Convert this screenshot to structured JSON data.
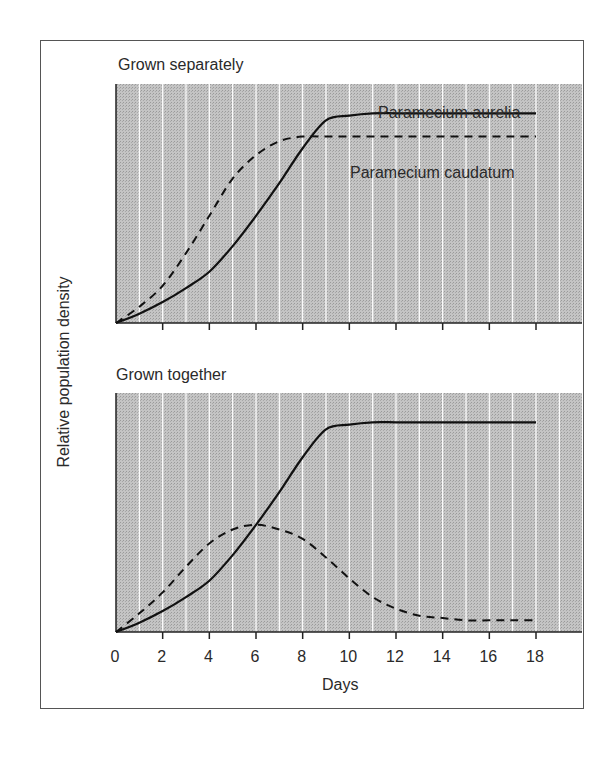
{
  "chart_data": [
    {
      "type": "line",
      "title": "Grown separately",
      "xlabel": "Days",
      "ylabel": "Relative population density",
      "x": [
        0,
        1,
        2,
        3,
        4,
        5,
        6,
        7,
        8,
        9,
        10,
        11,
        12,
        13,
        14,
        15,
        16,
        17,
        18
      ],
      "xlim": [
        0,
        18
      ],
      "xticks": [
        0,
        2,
        4,
        6,
        8,
        10,
        12,
        14,
        16,
        18
      ],
      "ylim": [
        0,
        1
      ],
      "grid": "vertical white lines every 1 day",
      "series": [
        {
          "name": "Paramecium aurelia",
          "style": "solid",
          "values": [
            0.0,
            0.04,
            0.09,
            0.15,
            0.22,
            0.33,
            0.46,
            0.6,
            0.75,
            0.87,
            0.89,
            0.9,
            0.9,
            0.9,
            0.9,
            0.9,
            0.9,
            0.9,
            0.9
          ]
        },
        {
          "name": "Paramecium caudatum",
          "style": "dashed",
          "values": [
            0.0,
            0.07,
            0.16,
            0.3,
            0.46,
            0.62,
            0.72,
            0.78,
            0.8,
            0.8,
            0.8,
            0.8,
            0.8,
            0.8,
            0.8,
            0.8,
            0.8,
            0.8,
            0.8
          ]
        }
      ],
      "annotations": [
        "Paramecium aurelia",
        "Paramecium caudatum"
      ]
    },
    {
      "type": "line",
      "title": "Grown together",
      "xlabel": "Days",
      "ylabel": "Relative population density",
      "x": [
        0,
        1,
        2,
        3,
        4,
        5,
        6,
        7,
        8,
        9,
        10,
        11,
        12,
        13,
        14,
        15,
        16,
        17,
        18
      ],
      "xlim": [
        0,
        18
      ],
      "xticks": [
        0,
        2,
        4,
        6,
        8,
        10,
        12,
        14,
        16,
        18
      ],
      "ylim": [
        0,
        1
      ],
      "grid": "vertical white lines every 1 day",
      "series": [
        {
          "name": "Paramecium aurelia",
          "style": "solid",
          "values": [
            0.0,
            0.04,
            0.09,
            0.15,
            0.22,
            0.33,
            0.46,
            0.6,
            0.75,
            0.87,
            0.89,
            0.9,
            0.9,
            0.9,
            0.9,
            0.9,
            0.9,
            0.9,
            0.9
          ]
        },
        {
          "name": "Paramecium caudatum",
          "style": "dashed",
          "values": [
            0.0,
            0.08,
            0.17,
            0.28,
            0.38,
            0.44,
            0.46,
            0.44,
            0.4,
            0.32,
            0.23,
            0.15,
            0.1,
            0.07,
            0.06,
            0.05,
            0.05,
            0.05,
            0.05
          ]
        }
      ]
    }
  ],
  "labels": {
    "panel1_title": "Grown separately",
    "panel2_title": "Grown together",
    "ylabel": "Relative population density",
    "xlabel": "Days",
    "legend_aurelia": "Paramecium aurelia",
    "legend_caudatum": "Paramecium caudatum",
    "xticks": [
      "0",
      "2",
      "4",
      "6",
      "8",
      "10",
      "12",
      "14",
      "16",
      "18"
    ]
  },
  "colors": {
    "plot_bg": "#b9b9b9",
    "grid": "#ffffff",
    "line": "#111111",
    "frame": "#555555"
  }
}
